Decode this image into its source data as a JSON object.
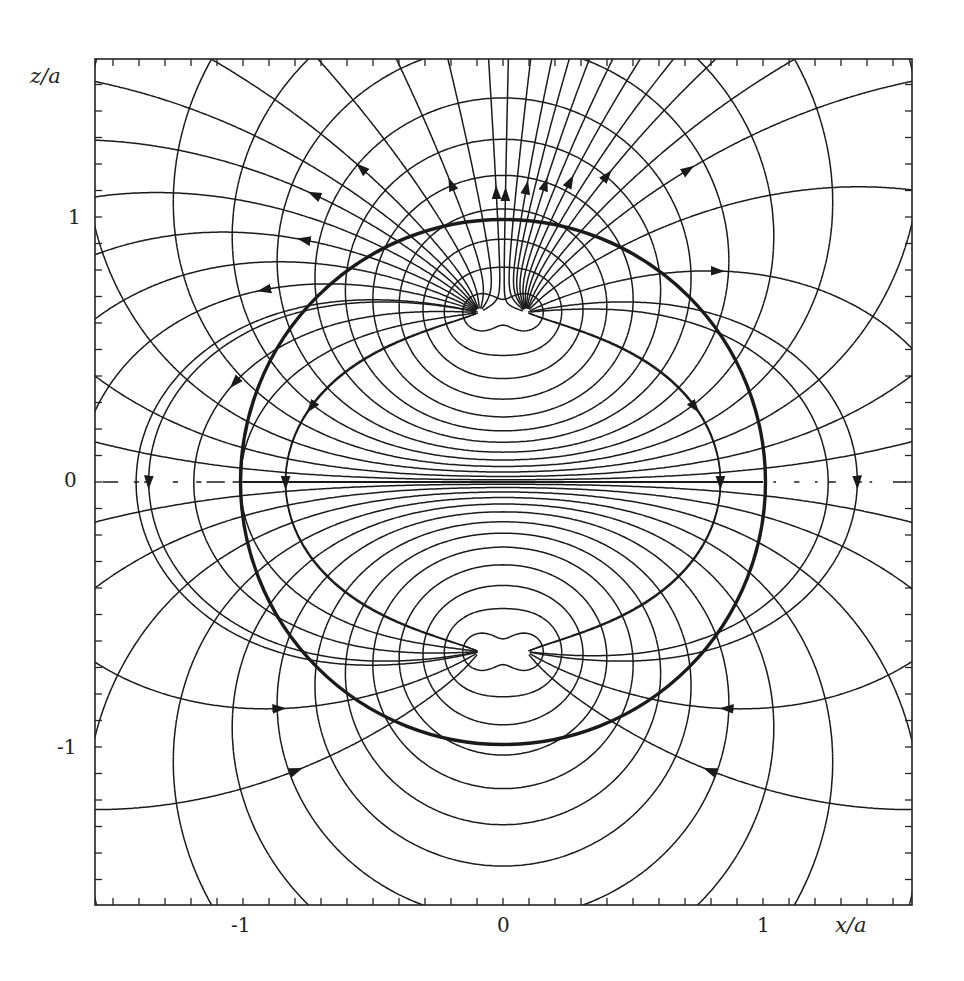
{
  "chart_data": {
    "type": "line",
    "title": "",
    "xlabel": "x/a",
    "ylabel": "z/a",
    "xlim": [
      -1.57,
      1.57
    ],
    "ylim": [
      -1.6,
      1.6
    ],
    "grid": false,
    "legend": null,
    "x_ticks": [
      {
        "value": -1,
        "label": "-1"
      },
      {
        "value": 0,
        "label": "0"
      },
      {
        "value": 1,
        "label": "1"
      }
    ],
    "y_ticks": [
      {
        "value": 1,
        "label": "1"
      },
      {
        "value": 0,
        "label": "0"
      },
      {
        "value": -1,
        "label": "-1"
      }
    ],
    "minor_tick_step": 0.1,
    "annotations": [],
    "elements": {
      "sphere": {
        "shape": "circle",
        "center": [
          0,
          0
        ],
        "radius": 1.0,
        "style": "thick-solid"
      },
      "equatorial_line": {
        "from": [
          -1,
          0
        ],
        "to": [
          1,
          0
        ],
        "style": "solid"
      },
      "foci": [
        [
          -0.09,
          0.64
        ],
        [
          0.09,
          0.64
        ],
        [
          -0.09,
          -0.64
        ],
        [
          0.09,
          -0.64
        ]
      ],
      "field_lines": {
        "style": "solid-with-arrows",
        "direction": "from upper focus to lower focus",
        "source": [
          0,
          0.64
        ],
        "sink": [
          0,
          -0.64
        ]
      },
      "equipotentials": {
        "style": "dashed"
      }
    },
    "series": [
      {
        "name": "field lines",
        "style": "solid",
        "arrows": true
      },
      {
        "name": "equipotentials",
        "style": "dashed"
      },
      {
        "name": "sphere boundary",
        "style": "thick solid",
        "radius": 1.0
      }
    ]
  },
  "axes": {
    "x_label": "x/a",
    "y_label": "z/a",
    "x_tick_labels": [
      "-1",
      "0",
      "1"
    ],
    "y_tick_labels": [
      "1",
      "0",
      "-1"
    ]
  },
  "colors": {
    "ink": "#1a1a1a",
    "background": "#ffffff"
  }
}
